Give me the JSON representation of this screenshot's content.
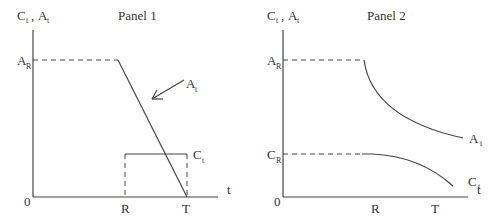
{
  "panel1": {
    "title": "Panel   1",
    "y_axis_label": {
      "main1": "C",
      "sub1": "t",
      "sep": " , ",
      "main2": "A",
      "sub2": "t"
    },
    "origin": "0",
    "x_axis_label": "t",
    "x_ticks": [
      "R",
      "T"
    ],
    "level_label": {
      "main": "A",
      "sub": "R"
    },
    "curve_labels": {
      "asset": {
        "main": "A",
        "sub": "t"
      },
      "consumption": {
        "main": "C",
        "sub": "t"
      }
    }
  },
  "panel2": {
    "title": "Panel   2",
    "y_axis_label": {
      "main1": "C",
      "sub1": "t",
      "sep": " , ",
      "main2": "A",
      "sub2": "t"
    },
    "origin": "0",
    "x_axis_label": "t",
    "x_ticks": [
      "R",
      "T"
    ],
    "level_labels": [
      {
        "main": "A",
        "sub": "R"
      },
      {
        "main": "C",
        "sub": "R"
      }
    ],
    "curve_labels": {
      "asset": {
        "main": "A",
        "sub": "t"
      },
      "consumption": {
        "main": "C",
        "sub": "t"
      }
    }
  }
}
